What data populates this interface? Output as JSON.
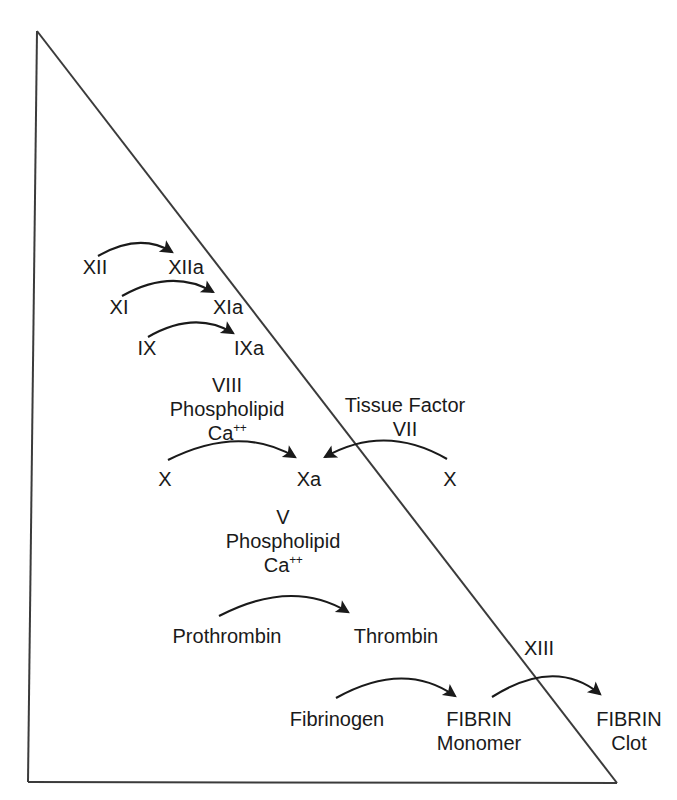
{
  "figure": {
    "type": "diagram",
    "background_color": "#ffffff",
    "ink_color": "#1a1a1a"
  },
  "frame": {
    "shape_name": "right-triangle",
    "apex": [
      37,
      31
    ],
    "bottom_left": [
      28,
      782
    ],
    "bottom_right": [
      617,
      783
    ],
    "stroke": "#3b3b3b",
    "stroke_width": 2
  },
  "cascade": {
    "intrinsic": {
      "step1": {
        "from": "XII",
        "to": "XIIa"
      },
      "step2": {
        "from": "XI",
        "to": "XIa"
      },
      "step3": {
        "from": "IX",
        "to": "IXa"
      },
      "complex": {
        "line1": "VIII",
        "line2": "Phospholipid",
        "line3_base": "Ca",
        "line3_sup": "++"
      },
      "substrate": "X"
    },
    "extrinsic": {
      "complex": {
        "line1": "Tissue Factor",
        "line2": "VII"
      },
      "substrate": "X"
    },
    "common": {
      "factor_xa": "Xa",
      "prothrombinase": {
        "line1": "V",
        "line2": "Phospholipid",
        "line3_base": "Ca",
        "line3_sup": "++"
      },
      "prothrombin": "Prothrombin",
      "thrombin": "Thrombin",
      "fibrinogen": "Fibrinogen",
      "fibrin_monomer": {
        "line1": "FIBRIN",
        "line2": "Monomer"
      },
      "factor_xiii": "XIII",
      "fibrin_clot": {
        "line1": "FIBRIN",
        "line2": "Clot"
      }
    }
  }
}
